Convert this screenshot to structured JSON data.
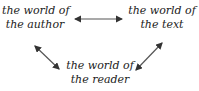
{
  "diagram": {
    "nodes": [
      {
        "id": "author",
        "line1": "the world of",
        "line2": "the author"
      },
      {
        "id": "text",
        "line1": "the world of",
        "line2": "the text"
      },
      {
        "id": "reader",
        "line1": "the world of",
        "line2": "the reader"
      }
    ],
    "edges": [
      {
        "from": "author",
        "to": "text",
        "direction": "both"
      },
      {
        "from": "author",
        "to": "reader",
        "direction": "both"
      },
      {
        "from": "text",
        "to": "reader",
        "direction": "both"
      }
    ],
    "colors": {
      "text": "#222222",
      "arrow": "#333333",
      "background": "#ffffff"
    }
  }
}
